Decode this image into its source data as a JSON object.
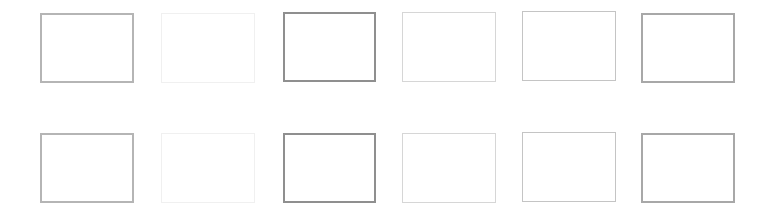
{
  "canvas": {
    "width": 772,
    "height": 215,
    "background": "#ffffff"
  },
  "rows": [
    {
      "boxes": [
        {
          "x": 40,
          "y": 13,
          "w": 94,
          "h": 70,
          "border_color": "#b5b5b5",
          "border_width": 2
        },
        {
          "x": 161,
          "y": 13,
          "w": 94,
          "h": 70,
          "border_color": "#f0f0f0",
          "border_width": 1
        },
        {
          "x": 283,
          "y": 12,
          "w": 93,
          "h": 70,
          "border_color": "#8f8f8f",
          "border_width": 2
        },
        {
          "x": 402,
          "y": 12,
          "w": 94,
          "h": 70,
          "border_color": "#d6d6d6",
          "border_width": 1
        },
        {
          "x": 522,
          "y": 11,
          "w": 94,
          "h": 70,
          "border_color": "#c4c4c4",
          "border_width": 1
        },
        {
          "x": 641,
          "y": 13,
          "w": 94,
          "h": 70,
          "border_color": "#a8a8a8",
          "border_width": 2
        }
      ]
    },
    {
      "boxes": [
        {
          "x": 40,
          "y": 133,
          "w": 94,
          "h": 70,
          "border_color": "#b5b5b5",
          "border_width": 2
        },
        {
          "x": 161,
          "y": 133,
          "w": 94,
          "h": 70,
          "border_color": "#f0f0f0",
          "border_width": 1
        },
        {
          "x": 283,
          "y": 133,
          "w": 93,
          "h": 70,
          "border_color": "#8f8f8f",
          "border_width": 2
        },
        {
          "x": 402,
          "y": 133,
          "w": 94,
          "h": 70,
          "border_color": "#d6d6d6",
          "border_width": 1
        },
        {
          "x": 522,
          "y": 132,
          "w": 94,
          "h": 70,
          "border_color": "#c4c4c4",
          "border_width": 1
        },
        {
          "x": 641,
          "y": 133,
          "w": 94,
          "h": 70,
          "border_color": "#a8a8a8",
          "border_width": 2
        }
      ]
    }
  ]
}
